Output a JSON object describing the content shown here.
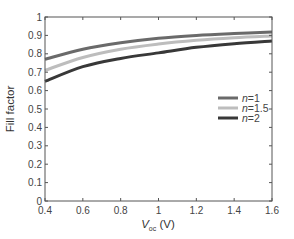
{
  "chart_data": {
    "type": "line",
    "title": "",
    "xlabel": "V_oc (V)",
    "xlabel_main": "V",
    "xlabel_sub": "oc",
    "xlabel_unit": " (V)",
    "ylabel": "Fill factor",
    "xlim": [
      0.4,
      1.6
    ],
    "ylim": [
      0,
      1
    ],
    "xticks": [
      "0.4",
      "0.6",
      "0.8",
      "1",
      "1.2",
      "1.4",
      "1.6"
    ],
    "yticks": [
      "0",
      "0.1",
      "0.2",
      "0.3",
      "0.4",
      "0.5",
      "0.6",
      "0.7",
      "0.8",
      "0.9",
      "1"
    ],
    "grid": false,
    "legend_position": "right-middle",
    "x": [
      0.4,
      0.6,
      0.8,
      1.0,
      1.2,
      1.4,
      1.6
    ],
    "series": [
      {
        "name": "n=1",
        "label_italic": "n",
        "label_rest": "=1",
        "color": "#6a6a6a",
        "values": [
          0.77,
          0.825,
          0.86,
          0.885,
          0.9,
          0.91,
          0.918
        ]
      },
      {
        "name": "n=1.5",
        "label_italic": "n",
        "label_rest": "=1.5",
        "color": "#bdbdbd",
        "values": [
          0.71,
          0.78,
          0.825,
          0.853,
          0.873,
          0.887,
          0.897
        ]
      },
      {
        "name": "n=2",
        "label_italic": "n",
        "label_rest": "=2",
        "color": "#383838",
        "values": [
          0.65,
          0.73,
          0.775,
          0.805,
          0.835,
          0.855,
          0.87
        ]
      }
    ]
  }
}
